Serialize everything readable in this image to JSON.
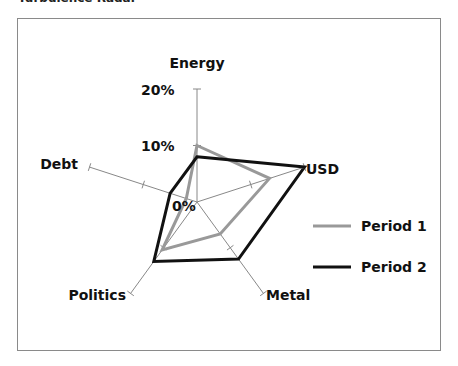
{
  "title": "Turbulence Radar",
  "legend": [
    {
      "label": "Period 1",
      "color": "#999999"
    },
    {
      "label": "Period 2",
      "color": "#111111"
    }
  ],
  "tick_labels": [
    "0%",
    "10%",
    "20%"
  ],
  "chart_data": {
    "type": "radar",
    "title": "Turbulence Radar",
    "categories": [
      "Energy",
      "USD",
      "Metal",
      "Politics",
      "Debt"
    ],
    "series": [
      {
        "name": "Period 1",
        "color": "#999999",
        "values": [
          10,
          13.5,
          7,
          10.5,
          2
        ]
      },
      {
        "name": "Period 2",
        "color": "#111111",
        "values": [
          8,
          20,
          12.5,
          13,
          5
        ]
      }
    ],
    "rlim": [
      0,
      20
    ],
    "ticks": [
      0,
      10,
      20
    ],
    "tick_format": "percent",
    "legend_position": "right"
  }
}
